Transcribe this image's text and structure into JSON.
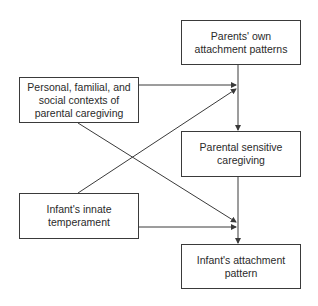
{
  "diagram": {
    "nodes": [
      {
        "id": "parents_attachment",
        "label": "Parents' own\nattachment patterns"
      },
      {
        "id": "contexts",
        "label": "Personal, familial, and\nsocial contexts of\nparental caregiving"
      },
      {
        "id": "sensitive_caregiving",
        "label": "Parental sensitive\ncaregiving"
      },
      {
        "id": "temperament",
        "label": "Infant's innate\ntemperament"
      },
      {
        "id": "infant_attachment",
        "label": "Infant's attachment\npattern"
      }
    ],
    "edges": [
      {
        "from": "parents_attachment",
        "to": "sensitive_caregiving"
      },
      {
        "from": "contexts",
        "to": "sensitive_caregiving"
      },
      {
        "from": "temperament",
        "to": "sensitive_caregiving"
      },
      {
        "from": "contexts",
        "to": "infant_attachment"
      },
      {
        "from": "temperament",
        "to": "infant_attachment"
      },
      {
        "from": "sensitive_caregiving",
        "to": "infant_attachment"
      }
    ],
    "colors": {
      "line": "#3a3a3a",
      "background": "#ffffff",
      "text": "#2a2a2a"
    }
  }
}
